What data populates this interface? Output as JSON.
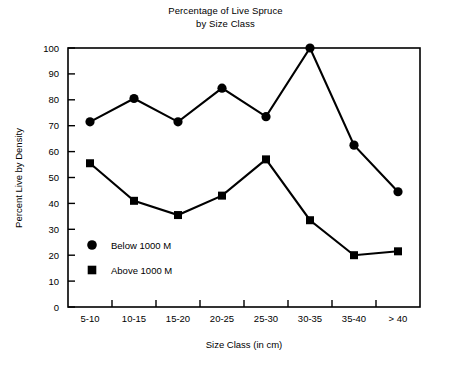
{
  "title": {
    "line1": "Percentage of Live Spruce",
    "line2": "by Size Class"
  },
  "axes": {
    "x_title": "Size Class (in cm)",
    "y_title": "Percent Live by Density",
    "y_ticks": [
      "0",
      "10",
      "20",
      "30",
      "40",
      "50",
      "60",
      "70",
      "80",
      "90",
      "100"
    ],
    "x_ticks": [
      "5-10",
      "10-15",
      "15-20",
      "20-25",
      "25-30",
      "30-35",
      "35-40",
      "> 40"
    ]
  },
  "legend": {
    "entries": [
      {
        "marker": "circle",
        "label": "Below 1000 M"
      },
      {
        "marker": "square",
        "label": "Above 1000 M"
      }
    ]
  },
  "colors": {
    "ink": "#000000",
    "background": "#ffffff"
  },
  "chart_data": {
    "type": "line",
    "title": "Percentage of Live Spruce by Size Class",
    "subtitle": "",
    "xlabel": "Size Class (in cm)",
    "ylabel": "Percent Live by Density",
    "categories": [
      "5-10",
      "10-15",
      "15-20",
      "20-25",
      "25-30",
      "30-35",
      "35-40",
      "> 40"
    ],
    "ylim": [
      0,
      100
    ],
    "ytick_step": 10,
    "grid": false,
    "legend_position": "inside-lower-left",
    "series": [
      {
        "name": "Below 1000 M",
        "marker": "circle",
        "values": [
          71.5,
          80.5,
          71.5,
          84.5,
          73.5,
          100,
          62.5,
          44.5
        ]
      },
      {
        "name": "Above 1000 M",
        "marker": "square",
        "values": [
          55.5,
          41,
          35.5,
          43,
          57,
          33.5,
          20,
          21.5
        ]
      }
    ]
  }
}
